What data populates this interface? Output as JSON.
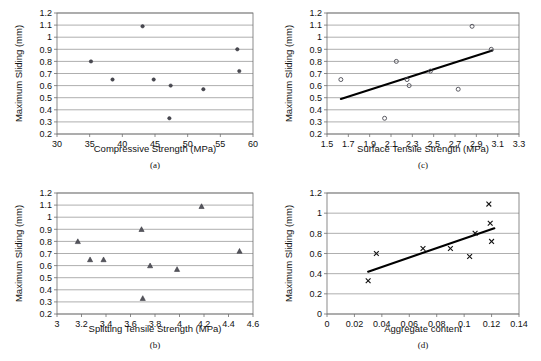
{
  "figure": {
    "shared_ylabel": "Maximum Sliding (mm)",
    "panels": [
      {
        "id": "a",
        "caption": "(a)",
        "xlabel": "Compressive Strength (MPa)",
        "ylabel": "Maximum Sliding (mm)",
        "marker": "filled-dot",
        "xticks": [
          "30",
          "35",
          "40",
          "45",
          "50",
          "55",
          "60"
        ],
        "yticks": [
          "0.2",
          "0.3",
          "0.4",
          "0.5",
          "0.6",
          "0.7",
          "0.8",
          "0.9",
          "1",
          "1.1",
          "1.2"
        ]
      },
      {
        "id": "c",
        "caption": "(c)",
        "xlabel": "Surface Tensile Strength (MPa)",
        "ylabel": "Maximum Sliding (mm)",
        "marker": "open-circle",
        "xticks": [
          "1.5",
          "1.7",
          "1.9",
          "2.1",
          "2.3",
          "2.5",
          "2.7",
          "2.9",
          "3.1",
          "3.3"
        ],
        "yticks": [
          "0.2",
          "0.3",
          "0.4",
          "0.5",
          "0.6",
          "0.7",
          "0.8",
          "0.9",
          "1",
          "1.1",
          "1.2"
        ]
      },
      {
        "id": "b",
        "caption": "(b)",
        "xlabel": "Splitting Tensile Strength (MPa)",
        "ylabel": "Maximum Sliding (mm)",
        "marker": "triangle",
        "xticks": [
          "3",
          "3.2",
          "3.4",
          "3.6",
          "3.8",
          "4",
          "4.2",
          "4.4",
          "4.6"
        ],
        "yticks": [
          "0.2",
          "0.3",
          "0.4",
          "0.5",
          "0.6",
          "0.7",
          "0.8",
          "0.9",
          "1",
          "1.1",
          "1.2"
        ]
      },
      {
        "id": "d",
        "caption": "(d)",
        "xlabel": "Aggregate content",
        "ylabel": "Maximum Sliding (mm)",
        "marker": "cross",
        "xticks": [
          "0",
          "0.02",
          "0.04",
          "0.06",
          "0.08",
          "0.1",
          "0.12",
          "0.14"
        ],
        "yticks": [
          "0",
          "0.2",
          "0.4",
          "0.6",
          "0.8",
          "1",
          "1.2"
        ]
      }
    ]
  },
  "chart_data": [
    {
      "type": "scatter",
      "panel": "a",
      "title": "(a)",
      "xlabel": "Compressive Strength (MPa)",
      "ylabel": "Maximum Sliding (mm)",
      "xlim": [
        30,
        60
      ],
      "ylim": [
        0.2,
        1.2
      ],
      "xticks": [
        30,
        35,
        40,
        45,
        50,
        55,
        60
      ],
      "yticks": [
        0.2,
        0.3,
        0.4,
        0.5,
        0.6,
        0.7,
        0.8,
        0.9,
        1.0,
        1.1,
        1.2
      ],
      "grid": "horizontal",
      "legend": "none",
      "marker": "filled-dot",
      "x": [
        35.2,
        38.5,
        43.1,
        44.8,
        47.2,
        47.4,
        52.4,
        57.6,
        57.9
      ],
      "y": [
        0.8,
        0.65,
        1.09,
        0.65,
        0.33,
        0.6,
        0.57,
        0.9,
        0.72
      ]
    },
    {
      "type": "scatter",
      "panel": "c",
      "title": "(c)",
      "xlabel": "Surface Tensile Strength (MPa)",
      "ylabel": "Maximum Sliding (mm)",
      "xlim": [
        1.5,
        3.3
      ],
      "ylim": [
        0.2,
        1.2
      ],
      "xticks": [
        1.5,
        1.7,
        1.9,
        2.1,
        2.3,
        2.5,
        2.7,
        2.9,
        3.1,
        3.3
      ],
      "yticks": [
        0.2,
        0.3,
        0.4,
        0.5,
        0.6,
        0.7,
        0.8,
        0.9,
        1.0,
        1.1,
        1.2
      ],
      "grid": "horizontal",
      "legend": "none",
      "marker": "open-circle",
      "x": [
        1.63,
        2.04,
        2.15,
        2.25,
        2.27,
        2.47,
        2.73,
        2.86,
        3.04
      ],
      "y": [
        0.65,
        0.33,
        0.8,
        0.65,
        0.6,
        0.72,
        0.57,
        1.09,
        0.9
      ],
      "trendline": {
        "x": [
          1.63,
          3.05
        ],
        "y": [
          0.49,
          0.89
        ]
      }
    },
    {
      "type": "scatter",
      "panel": "b",
      "title": "(b)",
      "xlabel": "Splitting Tensile Strength (MPa)",
      "ylabel": "Maximum Sliding (mm)",
      "xlim": [
        3.0,
        4.6
      ],
      "ylim": [
        0.2,
        1.2
      ],
      "xticks": [
        3.0,
        3.2,
        3.4,
        3.6,
        3.8,
        4.0,
        4.2,
        4.4,
        4.6
      ],
      "yticks": [
        0.2,
        0.3,
        0.4,
        0.5,
        0.6,
        0.7,
        0.8,
        0.9,
        1.0,
        1.1,
        1.2
      ],
      "grid": "horizontal",
      "legend": "none",
      "marker": "triangle",
      "x": [
        3.17,
        3.27,
        3.38,
        3.69,
        3.7,
        3.76,
        3.98,
        4.18,
        4.49
      ],
      "y": [
        0.8,
        0.65,
        0.65,
        0.9,
        0.33,
        0.6,
        0.57,
        1.09,
        0.72
      ]
    },
    {
      "type": "scatter",
      "panel": "d",
      "title": "(d)",
      "xlabel": "Aggregate content",
      "ylabel": "Maximum Sliding (mm)",
      "xlim": [
        0,
        0.14
      ],
      "ylim": [
        0,
        1.2
      ],
      "xticks": [
        0,
        0.02,
        0.04,
        0.06,
        0.08,
        0.1,
        0.12,
        0.14
      ],
      "yticks": [
        0,
        0.2,
        0.4,
        0.6,
        0.8,
        1.0,
        1.2
      ],
      "grid": "horizontal",
      "legend": "none",
      "marker": "cross",
      "x": [
        0.03,
        0.036,
        0.07,
        0.09,
        0.104,
        0.108,
        0.118,
        0.119,
        0.12
      ],
      "y": [
        0.33,
        0.6,
        0.65,
        0.65,
        0.57,
        0.8,
        1.09,
        0.9,
        0.72
      ],
      "trendline": {
        "x": [
          0.03,
          0.122
        ],
        "y": [
          0.42,
          0.85
        ]
      }
    }
  ]
}
